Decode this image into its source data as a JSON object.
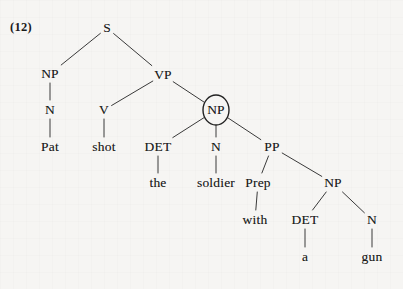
{
  "figure": {
    "example_number": "(12)",
    "circled_node_id": "np-object",
    "line_color": "#3a3a3a",
    "text_color": "#1b1b1b",
    "background_color": "#f6f5f3"
  },
  "tree": {
    "nodes": [
      {
        "id": "s",
        "label": "S",
        "kind": "category",
        "x": 107,
        "y": 28
      },
      {
        "id": "np-subj",
        "label": "NP",
        "kind": "category",
        "x": 50,
        "y": 74
      },
      {
        "id": "vp",
        "label": "VP",
        "kind": "category",
        "x": 163,
        "y": 75
      },
      {
        "id": "n-subj",
        "label": "N",
        "kind": "category",
        "x": 50,
        "y": 110
      },
      {
        "id": "v",
        "label": "V",
        "kind": "category",
        "x": 104,
        "y": 110
      },
      {
        "id": "np-object",
        "label": "NP",
        "kind": "category",
        "x": 216,
        "y": 110
      },
      {
        "id": "pat",
        "label": "Pat",
        "kind": "word",
        "x": 50,
        "y": 147
      },
      {
        "id": "shot",
        "label": "shot",
        "kind": "word",
        "x": 104,
        "y": 147
      },
      {
        "id": "det-1",
        "label": "DET",
        "kind": "category",
        "x": 158,
        "y": 147
      },
      {
        "id": "n-obj",
        "label": "N",
        "kind": "category",
        "x": 216,
        "y": 147
      },
      {
        "id": "pp",
        "label": "PP",
        "kind": "category",
        "x": 272,
        "y": 147
      },
      {
        "id": "the",
        "label": "the",
        "kind": "word",
        "x": 158,
        "y": 183
      },
      {
        "id": "soldier",
        "label": "soldier",
        "kind": "word",
        "x": 216,
        "y": 183
      },
      {
        "id": "prep",
        "label": "Prep",
        "kind": "category",
        "x": 258,
        "y": 183
      },
      {
        "id": "np-pp",
        "label": "NP",
        "kind": "category",
        "x": 333,
        "y": 183
      },
      {
        "id": "with",
        "label": "with",
        "kind": "word",
        "x": 255,
        "y": 220
      },
      {
        "id": "det-2",
        "label": "DET",
        "kind": "category",
        "x": 305,
        "y": 220
      },
      {
        "id": "n-gun",
        "label": "N",
        "kind": "category",
        "x": 372,
        "y": 220
      },
      {
        "id": "a",
        "label": "a",
        "kind": "word",
        "x": 305,
        "y": 257
      },
      {
        "id": "gun",
        "label": "gun",
        "kind": "word",
        "x": 372,
        "y": 257
      }
    ],
    "edges": [
      {
        "from": "s",
        "to": "np-subj"
      },
      {
        "from": "s",
        "to": "vp"
      },
      {
        "from": "np-subj",
        "to": "n-subj"
      },
      {
        "from": "n-subj",
        "to": "pat"
      },
      {
        "from": "vp",
        "to": "v"
      },
      {
        "from": "vp",
        "to": "np-object"
      },
      {
        "from": "v",
        "to": "shot"
      },
      {
        "from": "np-object",
        "to": "det-1"
      },
      {
        "from": "np-object",
        "to": "n-obj"
      },
      {
        "from": "np-object",
        "to": "pp"
      },
      {
        "from": "det-1",
        "to": "the"
      },
      {
        "from": "n-obj",
        "to": "soldier"
      },
      {
        "from": "pp",
        "to": "prep"
      },
      {
        "from": "pp",
        "to": "np-pp"
      },
      {
        "from": "prep",
        "to": "with"
      },
      {
        "from": "np-pp",
        "to": "det-2"
      },
      {
        "from": "np-pp",
        "to": "n-gun"
      },
      {
        "from": "det-2",
        "to": "a"
      },
      {
        "from": "n-gun",
        "to": "gun"
      }
    ],
    "circle": {
      "cx": 216,
      "cy": 110,
      "rx": 13,
      "ry": 15
    },
    "sentence": "Pat shot the soldier with a gun"
  }
}
